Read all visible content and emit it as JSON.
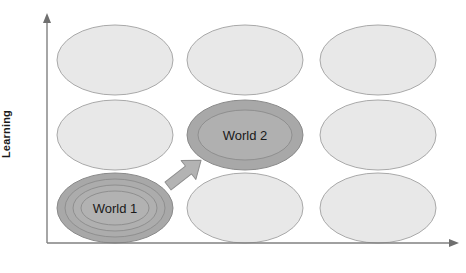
{
  "diagram": {
    "axes": {
      "y_label": "Learning",
      "x_label": "",
      "y_axis_name": "vertical-axis-arrow",
      "x_axis_name": "horizontal-axis-arrow",
      "axis_color": "#808080"
    },
    "colors": {
      "ellipse_light_fill": "#e8e8e8",
      "ellipse_light_stroke": "#a9a9a9",
      "ellipse_dark_fill": "#a8a8a8",
      "ellipse_dark_inner_fill": "#b0b0b0",
      "ellipse_dark_stroke": "#8a8a8a",
      "arrow_fill": "#b3b3b3",
      "arrow_stroke": "#8f8f8f",
      "label_text": "#1a1a1a",
      "background": "#ffffff"
    },
    "grid": {
      "rows": 3,
      "columns": 3,
      "cell_labels": [
        {
          "row": 0,
          "col": 0,
          "label": "",
          "highlighted": false,
          "rings": 0
        },
        {
          "row": 0,
          "col": 1,
          "label": "",
          "highlighted": false,
          "rings": 0
        },
        {
          "row": 0,
          "col": 2,
          "label": "",
          "highlighted": false,
          "rings": 0
        },
        {
          "row": 1,
          "col": 0,
          "label": "",
          "highlighted": false,
          "rings": 0
        },
        {
          "row": 1,
          "col": 1,
          "label": "World 2",
          "highlighted": true,
          "rings": 1
        },
        {
          "row": 1,
          "col": 2,
          "label": "",
          "highlighted": false,
          "rings": 0
        },
        {
          "row": 2,
          "col": 0,
          "label": "World 1",
          "highlighted": true,
          "rings": 3
        },
        {
          "row": 2,
          "col": 1,
          "label": "",
          "highlighted": false,
          "rings": 0
        },
        {
          "row": 2,
          "col": 2,
          "label": "",
          "highlighted": false,
          "rings": 0
        }
      ]
    },
    "labels": {
      "world1": "World 1",
      "world2": "World 2"
    },
    "arrow": {
      "name": "transition-arrow",
      "from": "World 1",
      "to": "World 2",
      "direction": "up-right"
    }
  }
}
